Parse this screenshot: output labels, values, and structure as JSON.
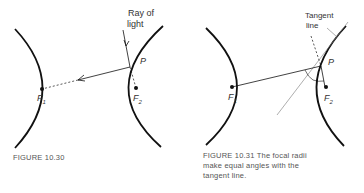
{
  "figures": [
    {
      "id": "fig-10-30",
      "caption": "FIGURE 10.30",
      "labels": {
        "ray": "Ray of\nlight",
        "ray_line1": "Ray of",
        "ray_line2": "light",
        "point": "P",
        "focus1": "F",
        "focus1_sub": "1",
        "focus2": "F",
        "focus2_sub": "2"
      }
    },
    {
      "id": "fig-10-31",
      "caption_line1": "FIGURE 10.31   The focal radii",
      "caption_line2": "make equal angles with the",
      "caption_line3": "tangent line.",
      "labels": {
        "tangent_line1": "Tangent",
        "tangent_line2": "line",
        "point": "P",
        "focus1": "F",
        "focus1_sub": "1",
        "focus2": "F",
        "focus2_sub": "2"
      }
    }
  ]
}
